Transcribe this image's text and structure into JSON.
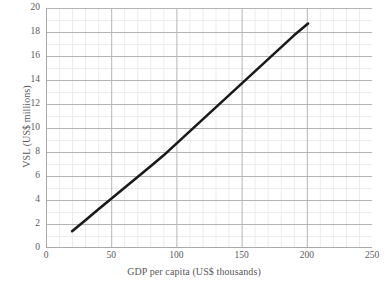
{
  "chart_data": {
    "type": "line",
    "title": "",
    "subtitle": "",
    "xlabel": "GDP  per capita (US$ thousands)",
    "ylabel": "VSL (US$ millions)",
    "xlim": [
      0,
      250
    ],
    "ylim": [
      0,
      20
    ],
    "xticks": [
      0,
      50,
      100,
      150,
      200,
      250
    ],
    "xtick_labels": [
      "0",
      "50",
      "100",
      "150",
      "200",
      "250"
    ],
    "yticks": [
      0,
      2,
      4,
      6,
      8,
      10,
      12,
      14,
      16,
      18,
      20
    ],
    "ytick_labels": [
      "0",
      "2",
      "4",
      "6",
      "8",
      "10",
      "12",
      "14",
      "16",
      "18",
      "20"
    ],
    "grid": {
      "major_x": true,
      "major_y": true,
      "minor_x": true,
      "minor_y": true,
      "major_x_step": 50,
      "major_y_step": 2,
      "minor_x_step": 10,
      "minor_y_step": 1,
      "major_color": "#b4b4b4",
      "minor_color": "#ececec"
    },
    "legend": {
      "visible": false,
      "position": "none"
    },
    "series": [
      {
        "name": "VSL vs GDP per capita",
        "color": "#1a1a1a",
        "line_width": 2.6,
        "markers": false,
        "x": [
          20,
          30,
          40,
          50,
          60,
          70,
          80,
          90,
          100,
          110,
          120,
          130,
          140,
          150,
          160,
          170,
          180,
          190,
          201
        ],
        "y": [
          1.4,
          2.3,
          3.2,
          4.1,
          5.0,
          5.9,
          6.8,
          7.7,
          8.7,
          9.7,
          10.7,
          11.7,
          12.7,
          13.7,
          14.7,
          15.7,
          16.7,
          17.7,
          18.7
        ]
      }
    ],
    "axis_line_color": "#a9a9a9",
    "text_color": "#58595b",
    "background": "#ffffff"
  }
}
